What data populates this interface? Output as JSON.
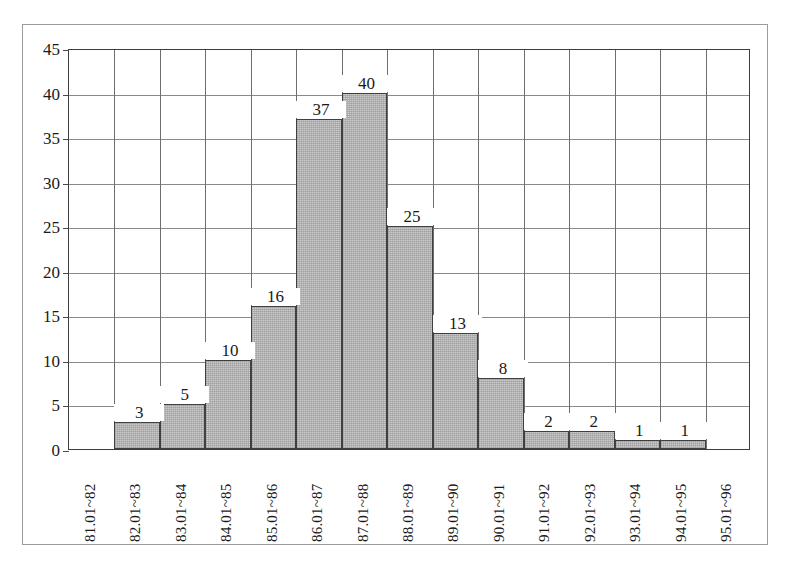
{
  "chart_data": {
    "type": "bar",
    "title": "",
    "subtitle": "",
    "xlabel": "",
    "ylabel": "",
    "categories": [
      "81.01~82",
      "82.01~83",
      "83.01~84",
      "84.01~85",
      "85.01~86",
      "86.01~87",
      "87.01~88",
      "88.01~89",
      "89.01~90",
      "90.01~91",
      "91.01~92",
      "92.01~93",
      "93.01~94",
      "94.01~95",
      "95.01~96"
    ],
    "values": [
      0,
      3,
      5,
      10,
      16,
      37,
      40,
      25,
      13,
      8,
      2,
      2,
      1,
      1,
      0
    ],
    "bar_labels": [
      "",
      "3",
      "5",
      "10",
      "16",
      "37",
      "40",
      "25",
      "13",
      "8",
      "2",
      "2",
      "1",
      "1",
      ""
    ],
    "ylim": [
      0,
      45
    ],
    "ytick_step": 5,
    "yticks": [
      "0",
      "5",
      "10",
      "15",
      "20",
      "25",
      "30",
      "35",
      "40",
      "45"
    ],
    "grid": true,
    "legend": "none",
    "colors": {
      "bar_fill": "#cccccc",
      "bar_edge": "#404040",
      "grid": "#8a8a8a",
      "axis": "#3d3d3d",
      "text": "#1a1a1a",
      "frame": "#9b9b9b",
      "background": "#ffffff"
    }
  }
}
